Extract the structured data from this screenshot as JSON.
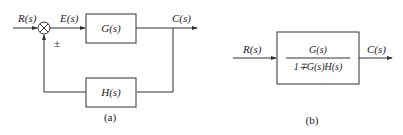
{
  "diagram_a": {
    "caption": "(a)",
    "input_label": "R(s)",
    "error_label": "E(s)",
    "output_label": "C(s)",
    "forward_block": "G(s)",
    "feedback_block": "H(s)",
    "sign_label": "±"
  },
  "diagram_b": {
    "caption": "(b)",
    "input_label": "R(s)",
    "output_label": "C(s)",
    "numerator": "G(s)",
    "denominator": "1∓G(s)H(s)"
  }
}
